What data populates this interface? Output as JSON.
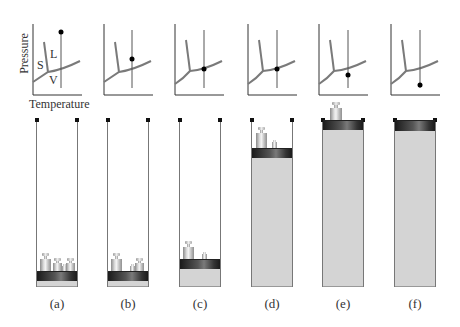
{
  "figure": {
    "axes_labels": {
      "y": "Pressure",
      "x": "Temperature"
    },
    "region_labels": {
      "solid": "S",
      "liquid": "L",
      "vapor": "V"
    },
    "colors": {
      "curve": "#7a7a7a",
      "axis": "#333333",
      "gas": "#d4d4d4",
      "piston": "#2a2a2a",
      "dot": "#000000"
    },
    "panels": [
      {
        "id": "a",
        "label": "(a)",
        "state_point": "liquid, high pressure",
        "gas_height": 6,
        "piston_top": 271,
        "weights": 4
      },
      {
        "id": "b",
        "label": "(b)",
        "state_point": "on liquid-vapor curve",
        "gas_height": 6,
        "piston_top": 271,
        "weights": 3
      },
      {
        "id": "c",
        "label": "(c)",
        "state_point": "on liquid-vapor curve",
        "gas_height": 19,
        "piston_top": 259,
        "weights": 2
      },
      {
        "id": "d",
        "label": "(d)",
        "state_point": "on liquid-vapor curve",
        "gas_height": 129,
        "piston_top": 148,
        "weights": 2
      },
      {
        "id": "e",
        "label": "(e)",
        "state_point": "vapor, below curve",
        "gas_height": 158,
        "piston_top": 120,
        "weights": 1
      },
      {
        "id": "f",
        "label": "(f)",
        "state_point": "vapor, low pressure",
        "gas_height": 163,
        "piston_top": 120,
        "weights": 0
      }
    ]
  }
}
